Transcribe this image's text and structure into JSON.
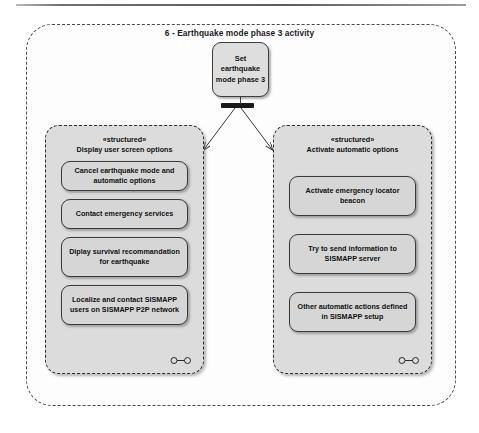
{
  "diagram": {
    "title": "6 - Earthquake mode phase 3 activity",
    "type": "uml-activity-diagram",
    "colors": {
      "frame_border": "#4a4a4a",
      "node_fill": "#d6d6d6",
      "container_fill": "#dcdcdc",
      "node_border": "#3b3b3b",
      "text": "#111111",
      "fork_bar": "#1a1a1a"
    },
    "start_node": {
      "label": "Set earthquake mode phase 3"
    },
    "fork": {
      "name": "fork-node",
      "outgoing": 2
    },
    "structured_activities": [
      {
        "stereotype": "«structured»",
        "name": "Display user screen options",
        "marker": "expansion-region-marker",
        "actions": [
          {
            "label": "Cancel earthquake mode and automatic options",
            "lines": 2
          },
          {
            "label": "Contact emergency services",
            "lines": 2
          },
          {
            "label": "Diplay survival recommandation for earthquake",
            "lines": 3
          },
          {
            "label": "Localize and contact SISMAPP users on SISMAPP P2P network",
            "lines": 3
          }
        ]
      },
      {
        "stereotype": "«structured»",
        "name": "Activate automatic options",
        "marker": "expansion-region-marker",
        "actions": [
          {
            "label": "Activate emergency locator beacon",
            "lines": 2
          },
          {
            "label": "Try to send information to SISMAPP server",
            "lines": 2
          },
          {
            "label": "Other automatic actions defined in SISMAPP setup",
            "lines": 3
          }
        ]
      }
    ]
  }
}
